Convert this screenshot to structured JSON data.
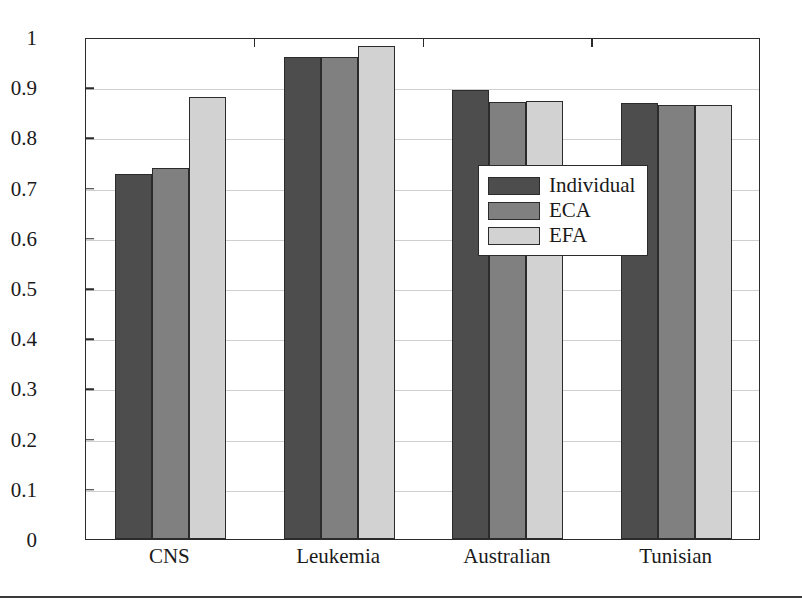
{
  "chart_data": {
    "type": "bar",
    "title": "",
    "xlabel": "",
    "ylabel": "",
    "ylim": [
      0,
      1
    ],
    "grid": true,
    "legend_position": "inside-upper-right",
    "categories": [
      "CNS",
      "Leukemia",
      "Australian",
      "Tunisian"
    ],
    "ytick_labels": [
      "0",
      "0.1",
      "0.2",
      "0.3",
      "0.4",
      "0.5",
      "0.6",
      "0.7",
      "0.8",
      "0.9",
      "1"
    ],
    "ytick_values": [
      0,
      0.1,
      0.2,
      0.3,
      0.4,
      0.5,
      0.6,
      0.7,
      0.8,
      0.9,
      1
    ],
    "series": [
      {
        "name": "Individual",
        "color": "#4d4d4d",
        "values": [
          0.727,
          0.96,
          0.894,
          0.868
        ]
      },
      {
        "name": "ECA",
        "color": "#808080",
        "values": [
          0.74,
          0.96,
          0.87,
          0.865
        ]
      },
      {
        "name": "EFA",
        "color": "#d2d2d2",
        "values": [
          0.88,
          0.982,
          0.872,
          0.864
        ]
      }
    ]
  },
  "legend": {
    "items": [
      {
        "label": "Individual",
        "swatch": "dark-gray-swatch"
      },
      {
        "label": "ECA",
        "swatch": "medium-gray-swatch"
      },
      {
        "label": "EFA",
        "swatch": "light-gray-swatch"
      }
    ]
  },
  "colors": {
    "individual": "#4d4d4d",
    "eca": "#808080",
    "efa": "#d2d2d2",
    "axis": "#2b2b2b",
    "grid": "#cfcfcf",
    "background": "#ffffff"
  }
}
